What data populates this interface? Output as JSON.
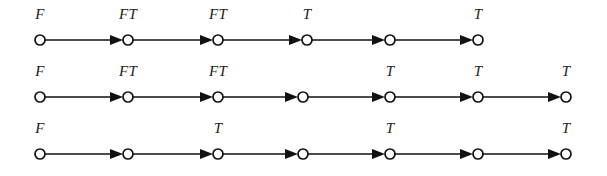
{
  "figure": {
    "background_color": "#ffffff",
    "stroke_color": "#111111",
    "label_color": "#1a1a1a",
    "node_fill": "#ffffff",
    "node_radius": 5,
    "width": 607,
    "height": 176
  },
  "chart_data": {
    "type": "diagram",
    "diagram_kind": "directed-chain-sequence",
    "title": "",
    "xlabel": "",
    "ylabel": "",
    "grid": false,
    "legend": null,
    "label_alphabet": [
      "F",
      "T",
      "FT"
    ],
    "chains": [
      {
        "id": "chain-1",
        "row": 1,
        "y": 40,
        "node_count": 6,
        "node_x": [
          40,
          128,
          218,
          307,
          390,
          478
        ],
        "labels": [
          "F",
          "FT",
          "FT",
          "T",
          "",
          "T"
        ],
        "label_y": 19,
        "edges": [
          {
            "from": 0,
            "to": 1
          },
          {
            "from": 1,
            "to": 2
          },
          {
            "from": 2,
            "to": 3
          },
          {
            "from": 3,
            "to": 4
          },
          {
            "from": 4,
            "to": 5
          }
        ]
      },
      {
        "id": "chain-2",
        "row": 2,
        "y": 97,
        "node_count": 7,
        "node_x": [
          40,
          128,
          218,
          303,
          390,
          478,
          566
        ],
        "labels": [
          "F",
          "FT",
          "FT",
          "",
          "T",
          "T",
          "T"
        ],
        "label_y": 76,
        "edges": [
          {
            "from": 0,
            "to": 1
          },
          {
            "from": 1,
            "to": 2
          },
          {
            "from": 2,
            "to": 3
          },
          {
            "from": 3,
            "to": 4
          },
          {
            "from": 4,
            "to": 5
          },
          {
            "from": 5,
            "to": 6
          }
        ]
      },
      {
        "id": "chain-3",
        "row": 3,
        "y": 154,
        "node_count": 7,
        "node_x": [
          40,
          128,
          218,
          303,
          390,
          478,
          566
        ],
        "labels": [
          "F",
          "",
          "T",
          "",
          "T",
          "",
          "T"
        ],
        "label_y": 133,
        "edges": [
          {
            "from": 0,
            "to": 1
          },
          {
            "from": 1,
            "to": 2
          },
          {
            "from": 2,
            "to": 3
          },
          {
            "from": 3,
            "to": 4
          },
          {
            "from": 4,
            "to": 5
          },
          {
            "from": 5,
            "to": 6
          }
        ]
      }
    ]
  }
}
